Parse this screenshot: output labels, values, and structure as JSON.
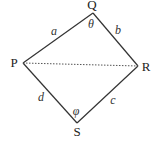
{
  "diagram": {
    "type": "quadrilateral",
    "vertices": [
      {
        "id": "Q",
        "label": "Q",
        "x": 93,
        "y": 13,
        "lx": 92,
        "ly": 9
      },
      {
        "id": "P",
        "label": "P",
        "x": 23,
        "y": 63,
        "lx": 14,
        "ly": 67
      },
      {
        "id": "R",
        "label": "R",
        "x": 138,
        "y": 66,
        "lx": 146,
        "ly": 71
      },
      {
        "id": "S",
        "label": "S",
        "x": 77,
        "y": 123,
        "lx": 77,
        "ly": 136
      }
    ],
    "sides": [
      {
        "from": "P",
        "to": "Q",
        "label": "a",
        "lx": 54,
        "ly": 35
      },
      {
        "from": "Q",
        "to": "R",
        "label": "b",
        "lx": 118,
        "ly": 34
      },
      {
        "from": "R",
        "to": "S",
        "label": "c",
        "lx": 113,
        "ly": 104
      },
      {
        "from": "S",
        "to": "P",
        "label": "d",
        "lx": 41,
        "ly": 101
      }
    ],
    "diagonal": {
      "from": "P",
      "to": "R",
      "style": "dotted"
    },
    "angles": [
      {
        "at": "Q",
        "label": "θ",
        "lx": 91,
        "ly": 28
      },
      {
        "at": "S",
        "label": "φ",
        "lx": 76,
        "ly": 115
      }
    ]
  }
}
